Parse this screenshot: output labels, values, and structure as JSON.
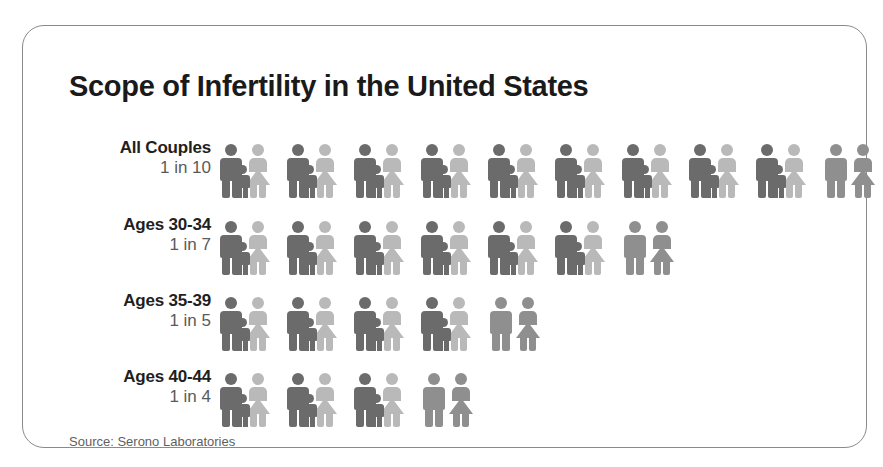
{
  "title": "Scope of Infertility in the United States",
  "source": "Source: Serono Laboratories",
  "colors": {
    "man_dark": "#6b6b6b",
    "woman_light": "#b9b9b9",
    "child_dark": "#6b6b6b",
    "couple_gray": "#8f8f8f",
    "border": "#8a8a8a",
    "title_text": "#1a1a1a",
    "label_text": "#1f1f1f",
    "sublabel_text": "#5a5a5a",
    "source_text": "#5f5f5f",
    "background": "#ffffff"
  },
  "chart_data": {
    "type": "pictogram",
    "title": "Scope of Infertility in the United States",
    "xlabel": "",
    "ylabel": "",
    "unit_meaning": "Each icon group represents one couple; the final gray couple without a child represents the infertile couple.",
    "legend": [
      {
        "name": "Fertile couple (with child)",
        "color": "#6b6b6b"
      },
      {
        "name": "Infertile couple (no child)",
        "color": "#8f8f8f"
      }
    ],
    "categories": [
      "All Couples",
      "Ages 30-34",
      "Ages 35-39",
      "Ages 40-44"
    ],
    "values": [
      10,
      7,
      5,
      4
    ],
    "ratios": [
      "1 in 10",
      "1 in 7",
      "1 in 5",
      "1 in 4"
    ],
    "rates": [
      0.1,
      0.142857,
      0.2,
      0.25
    ]
  },
  "rows": [
    {
      "label": "All Couples",
      "ratio": "1 in 10",
      "total": 10,
      "families": 9,
      "childless": 1,
      "units": [
        "family",
        "family",
        "family",
        "family",
        "family",
        "family",
        "family",
        "family",
        "family",
        "couple"
      ]
    },
    {
      "label": "Ages 30-34",
      "ratio": "1 in 7",
      "total": 7,
      "families": 6,
      "childless": 1,
      "units": [
        "family",
        "family",
        "family",
        "family",
        "family",
        "family",
        "couple"
      ]
    },
    {
      "label": "Ages 35-39",
      "ratio": "1 in 5",
      "total": 5,
      "families": 4,
      "childless": 1,
      "units": [
        "family",
        "family",
        "family",
        "family",
        "couple"
      ]
    },
    {
      "label": "Ages 40-44",
      "ratio": "1 in 4",
      "total": 4,
      "families": 3,
      "childless": 1,
      "units": [
        "family",
        "family",
        "family",
        "couple"
      ]
    }
  ]
}
